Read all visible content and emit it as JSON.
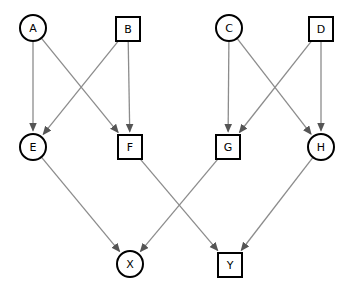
{
  "diagram": {
    "canvas": {
      "width": 353,
      "height": 289,
      "background": "#ffffff"
    },
    "style": {
      "node_fill": "#ffffff",
      "node_stroke": "#000000",
      "node_stroke_width": 2,
      "label_color": "#000000",
      "edge_color": "#8c8c8c",
      "edge_width": 1.3,
      "arrow_color": "#555555"
    },
    "nodes": [
      {
        "id": "A",
        "label": "A",
        "shape": "circle",
        "cx": 33,
        "cy": 28,
        "r": 13
      },
      {
        "id": "B",
        "label": "B",
        "shape": "square",
        "cx": 128,
        "cy": 29,
        "size": 24
      },
      {
        "id": "C",
        "label": "C",
        "shape": "circle",
        "cx": 229,
        "cy": 28,
        "r": 13
      },
      {
        "id": "D",
        "label": "D",
        "shape": "square",
        "cx": 321,
        "cy": 29,
        "size": 24
      },
      {
        "id": "E",
        "label": "E",
        "shape": "circle",
        "cx": 33,
        "cy": 147,
        "r": 13
      },
      {
        "id": "F",
        "label": "F",
        "shape": "square",
        "cx": 130,
        "cy": 147,
        "size": 24
      },
      {
        "id": "G",
        "label": "G",
        "shape": "square",
        "cx": 228,
        "cy": 147,
        "size": 24
      },
      {
        "id": "H",
        "label": "H",
        "shape": "circle",
        "cx": 321,
        "cy": 147,
        "r": 13
      },
      {
        "id": "X",
        "label": "X",
        "shape": "circle",
        "cx": 130,
        "cy": 264,
        "r": 13
      },
      {
        "id": "Y",
        "label": "Y",
        "shape": "square",
        "cx": 230,
        "cy": 265,
        "size": 24
      }
    ],
    "edges": [
      {
        "from": "A",
        "to": "E",
        "directed": true
      },
      {
        "from": "A",
        "to": "F",
        "directed": true
      },
      {
        "from": "B",
        "to": "E",
        "directed": true
      },
      {
        "from": "B",
        "to": "F",
        "directed": true
      },
      {
        "from": "C",
        "to": "G",
        "directed": true
      },
      {
        "from": "C",
        "to": "H",
        "directed": true
      },
      {
        "from": "D",
        "to": "G",
        "directed": true
      },
      {
        "from": "D",
        "to": "H",
        "directed": true
      },
      {
        "from": "E",
        "to": "X",
        "directed": true
      },
      {
        "from": "F",
        "to": "Y",
        "directed": true
      },
      {
        "from": "G",
        "to": "X",
        "directed": true
      },
      {
        "from": "H",
        "to": "Y",
        "directed": true
      }
    ]
  }
}
